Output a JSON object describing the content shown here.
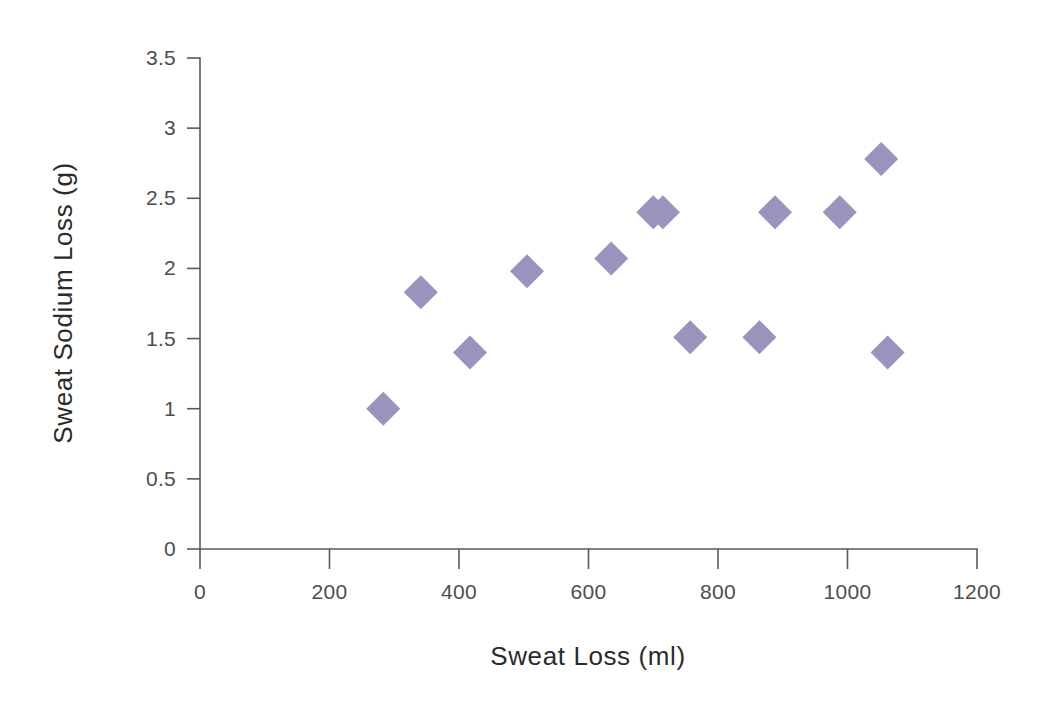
{
  "chart_data": {
    "type": "scatter",
    "title": "",
    "xlabel": "Sweat Loss (ml)",
    "ylabel": "Sweat Sodium Loss (g)",
    "xlim": [
      0,
      1200
    ],
    "ylim": [
      0,
      3.5
    ],
    "xticks": [
      0,
      200,
      400,
      600,
      800,
      1000,
      1200
    ],
    "yticks": [
      0,
      0.5,
      1,
      1.5,
      2,
      2.5,
      3,
      3.5
    ],
    "xtick_labels": [
      "0",
      "200",
      "400",
      "600",
      "800",
      "1000",
      "1200"
    ],
    "ytick_labels": [
      "0",
      "0.5",
      "1",
      "1.5",
      "2",
      "2.5",
      "3",
      "3.5"
    ],
    "grid": false,
    "legend": false,
    "marker_shape": "diamond",
    "marker_color": "#9A93BE",
    "axis_color": "#595959",
    "label_color": "#2b2b2b",
    "points": [
      {
        "x": 283,
        "y": 1.0
      },
      {
        "x": 341,
        "y": 1.83
      },
      {
        "x": 417,
        "y": 1.4
      },
      {
        "x": 505,
        "y": 1.98
      },
      {
        "x": 635,
        "y": 2.07
      },
      {
        "x": 700,
        "y": 2.4
      },
      {
        "x": 715,
        "y": 2.4
      },
      {
        "x": 757,
        "y": 1.51
      },
      {
        "x": 864,
        "y": 1.51
      },
      {
        "x": 888,
        "y": 2.4
      },
      {
        "x": 988,
        "y": 2.4
      },
      {
        "x": 1052,
        "y": 2.78
      },
      {
        "x": 1062,
        "y": 1.4
      }
    ]
  },
  "axes": {
    "x_title": "Sweat Loss (ml)",
    "y_title": "Sweat Sodium Loss (g)"
  }
}
